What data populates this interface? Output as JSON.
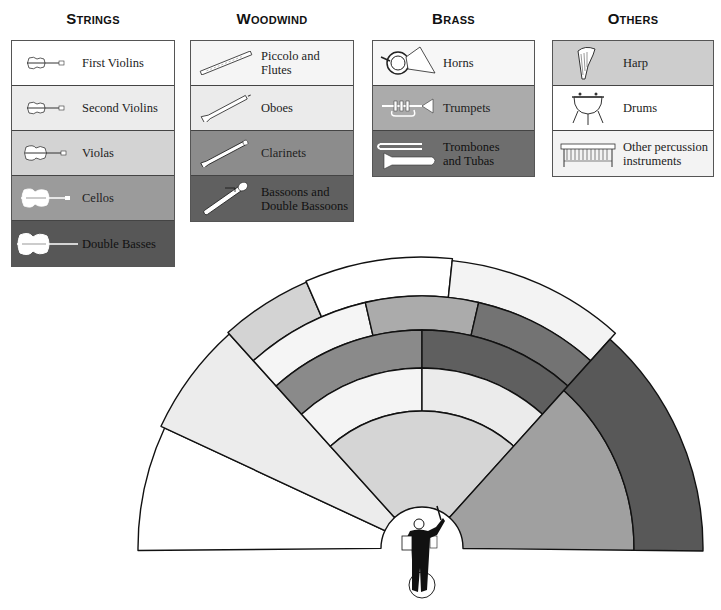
{
  "groups": [
    {
      "id": "strings",
      "title": "Strings",
      "x": 11,
      "w": 164,
      "items": [
        {
          "label": "First Violins",
          "color": "#ffffff",
          "icon": "violin-icon"
        },
        {
          "label": "Second Violins",
          "color": "#ececec",
          "icon": "violin-icon"
        },
        {
          "label": "Violas",
          "color": "#d3d3d3",
          "icon": "viola-icon"
        },
        {
          "label": "Cellos",
          "color": "#9b9b9b",
          "icon": "cello-icon"
        },
        {
          "label": "Double Basses",
          "color": "#575757",
          "icon": "double-bass-icon"
        }
      ]
    },
    {
      "id": "woodwind",
      "title": "Woodwind",
      "x": 190,
      "w": 164,
      "items": [
        {
          "label": "Piccolo and Flutes",
          "color": "#f5f5f5",
          "icon": "flute-icon"
        },
        {
          "label": "Oboes",
          "color": "#ebebeb",
          "icon": "oboe-icon"
        },
        {
          "label": "Clarinets",
          "color": "#8c8c8c",
          "icon": "clarinet-icon"
        },
        {
          "label": "Bassoons and\nDouble Bassoons",
          "color": "#606060",
          "icon": "bassoon-icon"
        }
      ]
    },
    {
      "id": "brass",
      "title": "Brass",
      "x": 372,
      "w": 163,
      "items": [
        {
          "label": "Horns",
          "color": "#f7f7f7",
          "icon": "horn-icon"
        },
        {
          "label": "Trumpets",
          "color": "#ababab",
          "icon": "trumpet-icon"
        },
        {
          "label": "Trombones\nand Tubas",
          "color": "#6e6e6e",
          "icon": "trombone-icon"
        }
      ]
    },
    {
      "id": "others",
      "title": "Others",
      "x": 552,
      "w": 162,
      "items": [
        {
          "label": "Harp",
          "color": "#cdcdcd",
          "icon": "harp-icon"
        },
        {
          "label": "Drums",
          "color": "#ffffff",
          "icon": "drum-icon"
        },
        {
          "label": "Other percussion\ninstruments",
          "color": "#f3f3f3",
          "icon": "percussion-icon"
        }
      ]
    }
  ],
  "diagram": {
    "center": [
      422,
      548
    ],
    "hub_radius": 41,
    "sectors": [
      {
        "name": "first-violins",
        "a0": 155,
        "a1": 180.5,
        "r0": 41,
        "r1": 284,
        "color": "#ffffff"
      },
      {
        "name": "second-violins",
        "a0": 132,
        "a1": 155,
        "r0": 41,
        "r1": 288,
        "color": "#ececec"
      },
      {
        "name": "harp",
        "a0": 113.5,
        "a1": 132,
        "r0": 252,
        "r1": 290,
        "color": "#d3d3d3"
      },
      {
        "name": "drums",
        "a0": 84,
        "a1": 113.5,
        "r0": 252,
        "r1": 291,
        "color": "#ffffff"
      },
      {
        "name": "other-percussion",
        "a0": 48,
        "a1": 84,
        "r0": 252,
        "r1": 289,
        "color": "#f3f3f3"
      },
      {
        "name": "horns",
        "a0": 103,
        "a1": 132,
        "r0": 218,
        "r1": 252,
        "color": "#f5f5f5"
      },
      {
        "name": "trumpets",
        "a0": 77,
        "a1": 103,
        "r0": 218,
        "r1": 252,
        "color": "#ababab"
      },
      {
        "name": "trombones-and-tubas",
        "a0": 48,
        "a1": 77,
        "r0": 218,
        "r1": 252,
        "color": "#737373"
      },
      {
        "name": "clarinets",
        "a0": 90,
        "a1": 132,
        "r0": 180,
        "r1": 218,
        "color": "#8a8a8a"
      },
      {
        "name": "bassoons",
        "a0": 48,
        "a1": 90,
        "r0": 180,
        "r1": 218,
        "color": "#5f5f5f"
      },
      {
        "name": "flutes",
        "a0": 90,
        "a1": 132,
        "r0": 137,
        "r1": 180,
        "color": "#f4f4f4"
      },
      {
        "name": "oboes",
        "a0": 48,
        "a1": 90,
        "r0": 137,
        "r1": 180,
        "color": "#ebebeb"
      },
      {
        "name": "violas",
        "a0": 48,
        "a1": 132,
        "r0": 41,
        "r1": 137,
        "color": "#d5d5d5"
      },
      {
        "name": "cellos",
        "a0": -0.6,
        "a1": 48,
        "r0": 41,
        "r1": 212,
        "color": "#a0a0a0"
      },
      {
        "name": "double-basses",
        "a0": -0.6,
        "a1": 48,
        "r0": 212,
        "r1": 281,
        "color": "#585858"
      }
    ]
  }
}
